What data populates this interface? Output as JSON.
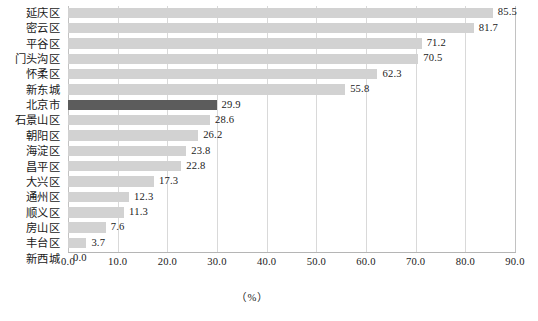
{
  "chart_data": {
    "type": "bar",
    "orientation": "horizontal",
    "title": "",
    "xlabel": "（%）",
    "ylabel": "",
    "xlim": [
      0.0,
      90.0
    ],
    "xticks": [
      "0.0",
      "10.0",
      "20.0",
      "30.0",
      "40.0",
      "50.0",
      "60.0",
      "70.0",
      "80.0",
      "90.0"
    ],
    "grid": true,
    "legend": null,
    "categories": [
      "延庆区",
      "密云区",
      "平谷区",
      "门头沟区",
      "怀柔区",
      "新东城",
      "北京市",
      "石景山区",
      "朝阳区",
      "海淀区",
      "昌平区",
      "大兴区",
      "通州区",
      "顺义区",
      "房山区",
      "丰台区",
      "新西城"
    ],
    "values": [
      85.5,
      81.7,
      71.2,
      70.5,
      62.3,
      55.8,
      29.9,
      28.6,
      26.2,
      23.8,
      22.8,
      17.3,
      12.3,
      11.3,
      7.6,
      3.7,
      0.0
    ],
    "value_labels": [
      "85.5",
      "81.7",
      "71.2",
      "70.5",
      "62.3",
      "55.8",
      "29.9",
      "28.6",
      "26.2",
      "23.8",
      "22.8",
      "17.3",
      "12.3",
      "11.3",
      "7.6",
      "3.7",
      "0.0"
    ],
    "highlight_category": "北京市",
    "colors": {
      "bar": "#d2d2d2",
      "bar_highlight": "#5c5c5c",
      "gridline": "#d9d9d9",
      "axis": "#b5b5b5",
      "text": "#1a1a1a",
      "background": "#ffffff"
    }
  },
  "axis": {
    "unit": "（%）"
  }
}
